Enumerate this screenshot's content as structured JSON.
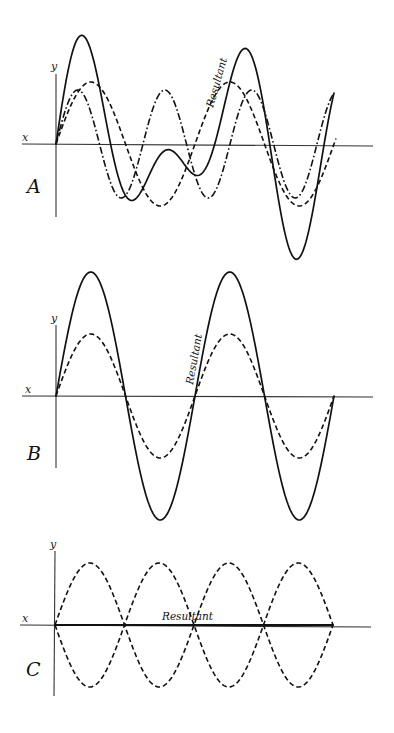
{
  "figure": {
    "axis_labels": {
      "x": "x",
      "y": "y"
    },
    "colors": {
      "ink": "#111111",
      "axis": "#333333",
      "background": "#ffffff"
    }
  },
  "panels": [
    {
      "id": "A",
      "label": "A",
      "resultant_label": "Resultant",
      "origin": [
        56,
        144
      ],
      "x_axis": [
        22,
        373
      ],
      "y_axis": [
        50,
        217
      ],
      "waves": [
        {
          "name": "component-1",
          "style": "dashed",
          "amplitude": 62,
          "wavelength": 139,
          "phase": 0,
          "x_end": 336
        },
        {
          "name": "component-2",
          "style": "dashdot",
          "amplitude": 54,
          "wavelength": 87,
          "phase": 0,
          "x_end": 334
        }
      ],
      "resultant": {
        "style": "solid",
        "x_end": 334
      }
    },
    {
      "id": "B",
      "label": "B",
      "resultant_label": "Resultant",
      "origin": [
        56,
        396
      ],
      "x_axis": [
        22,
        373
      ],
      "y_axis": [
        324,
        468
      ],
      "waves": [
        {
          "name": "component-1",
          "style": "dashed",
          "amplitude": 62,
          "wavelength": 139,
          "phase": 0,
          "x_end": 334
        },
        {
          "name": "component-2",
          "style": "dashed",
          "amplitude": 62,
          "wavelength": 139,
          "phase": 0,
          "x_end": 334
        }
      ],
      "resultant": {
        "style": "solid",
        "x_end": 334
      }
    },
    {
      "id": "C",
      "label": "C",
      "resultant_label": "Resultant",
      "origin": [
        55,
        625
      ],
      "x_axis": [
        20,
        371
      ],
      "y_axis": [
        551,
        696
      ],
      "waves": [
        {
          "name": "component-1",
          "style": "dashed",
          "amplitude": 62,
          "wavelength": 139,
          "phase": 0,
          "x_end": 333
        },
        {
          "name": "component-2",
          "style": "dashed",
          "amplitude": 62,
          "wavelength": 139,
          "phase": 3.14159265,
          "x_end": 333
        }
      ],
      "resultant": {
        "style": "solid",
        "x_end": 333
      }
    }
  ]
}
